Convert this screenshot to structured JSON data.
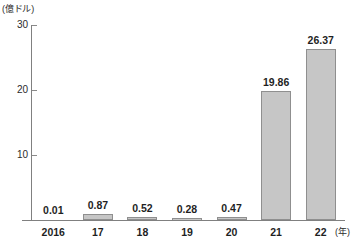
{
  "chart_data": {
    "type": "bar",
    "title": "",
    "subtitle": "",
    "xlabel": "(年)",
    "ylabel": "(億ドル)",
    "categories": [
      "2016",
      "17",
      "18",
      "19",
      "20",
      "21",
      "22"
    ],
    "values": [
      0.01,
      0.87,
      0.52,
      0.28,
      0.47,
      19.86,
      26.37
    ],
    "value_labels": [
      "0.01",
      "0.87",
      "0.52",
      "0.28",
      "0.47",
      "19.86",
      "26.37"
    ],
    "ylim": [
      0,
      30
    ],
    "yticks": [
      10,
      20,
      30
    ],
    "ytick_labels": [
      "10",
      "20",
      "30"
    ],
    "grid": false,
    "legend": false,
    "series": [
      {
        "name": "",
        "values": [
          0.01,
          0.87,
          0.52,
          0.28,
          0.47,
          19.86,
          26.37
        ]
      }
    ],
    "colors": {
      "bar_fill": "#c6c6c6",
      "bar_border": "#8f8f8f",
      "axis": "#808080",
      "text": "#1f1f1f",
      "background": "#ffffff"
    }
  }
}
